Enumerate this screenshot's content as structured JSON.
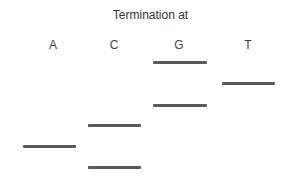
{
  "title": "Termination at",
  "lanes": [
    {
      "label": "A",
      "center_x": 53
    },
    {
      "label": "C",
      "center_x": 114
    },
    {
      "label": "G",
      "center_x": 179
    },
    {
      "label": "T",
      "center_x": 248
    }
  ],
  "bands": [
    {
      "lane": "G",
      "x": 153,
      "y": 61,
      "width": 54
    },
    {
      "lane": "T",
      "x": 222,
      "y": 82,
      "width": 53
    },
    {
      "lane": "G",
      "x": 153,
      "y": 104,
      "width": 54
    },
    {
      "lane": "C",
      "x": 88,
      "y": 124,
      "width": 53
    },
    {
      "lane": "A",
      "x": 23,
      "y": 145,
      "width": 53
    },
    {
      "lane": "C",
      "x": 88,
      "y": 166,
      "width": 53
    }
  ],
  "colors": {
    "band": "#5a5a5a",
    "text": "#333333"
  }
}
